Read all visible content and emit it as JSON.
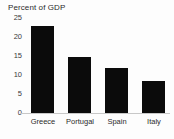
{
  "chart_data": {
    "type": "bar",
    "title": "Percent of GDP",
    "subtitle": "",
    "xlabel": "",
    "ylabel": "",
    "categories": [
      "Greece",
      "Portugal",
      "Spain",
      "Italy"
    ],
    "values": [
      23,
      14.7,
      11.8,
      8.4
    ],
    "ylim": [
      0,
      25
    ],
    "yticks": [
      0,
      5,
      10,
      15,
      20,
      25
    ],
    "ytick_labels": [
      "0",
      "5",
      "10",
      "15",
      "20",
      "25"
    ],
    "grid": false,
    "legend": false,
    "bar_color": "#0b0b0b",
    "axis_color": "#c8c8c8",
    "background_color": "#fdfdfd",
    "text_color": "#2b2b2b"
  }
}
